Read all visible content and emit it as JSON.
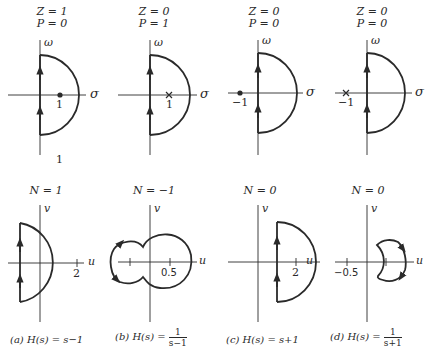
{
  "figure": {
    "top_row": [
      {
        "id": "a",
        "z_label": "Z = 1",
        "p_label": "P = 0",
        "vertical_axis": "ω",
        "horizontal_axis": "σ",
        "marker": "zero",
        "marker_label": "1",
        "extra_label": "1"
      },
      {
        "id": "b",
        "z_label": "Z = 0",
        "p_label": "P = 1",
        "vertical_axis": "ω",
        "horizontal_axis": "σ",
        "marker": "pole",
        "marker_label": "1"
      },
      {
        "id": "c",
        "z_label": "Z = 0",
        "p_label": "P = 0",
        "vertical_axis": "ω",
        "horizontal_axis": "σ",
        "marker": "zero",
        "marker_label": "−1"
      },
      {
        "id": "d",
        "z_label": "Z = 0",
        "p_label": "P = 0",
        "vertical_axis": "ω",
        "horizontal_axis": "σ",
        "marker": "pole",
        "marker_label": "−1"
      }
    ],
    "bottom_row": [
      {
        "id": "a",
        "n_label": "N = 1",
        "vertical_axis": "v",
        "horizontal_axis": "u",
        "tick_label": "2",
        "caption_prefix": "(a) H(s) = s−1"
      },
      {
        "id": "b",
        "n_label": "N = −1",
        "vertical_axis": "v",
        "horizontal_axis": "u",
        "tick_label": "0.5",
        "caption_prefix": "(b) H(s) =",
        "caption_num": "1",
        "caption_den": "s−1"
      },
      {
        "id": "c",
        "n_label": "N = 0",
        "vertical_axis": "v",
        "horizontal_axis": "u",
        "tick_label": "2",
        "caption_prefix": "(c) H(s) = s+1"
      },
      {
        "id": "d",
        "n_label": "N = 0",
        "vertical_axis": "v",
        "horizontal_axis": "u",
        "tick_label": "−0.5",
        "caption_prefix": "(d) H(s) =",
        "caption_num": "1",
        "caption_den": "s+1"
      }
    ]
  }
}
